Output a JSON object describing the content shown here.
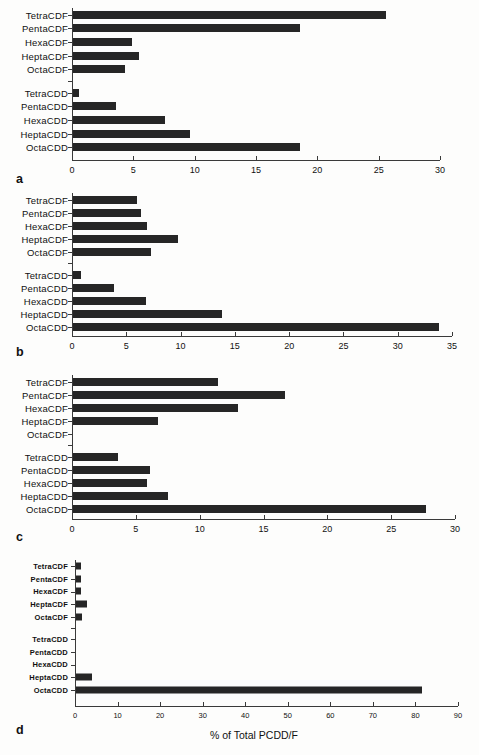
{
  "figure": {
    "xlabel": "% of Total PCDD/F",
    "bar_color": "#262626",
    "axis_color": "#3a3a3a"
  },
  "chart_data": [
    {
      "type": "bar",
      "orientation": "horizontal",
      "panel": "a",
      "title": "",
      "xlabel": "",
      "ylabel": "",
      "xlim": [
        0,
        30
      ],
      "xticks": [
        0,
        5,
        10,
        15,
        20,
        25,
        30
      ],
      "xtick_labels": [
        "0",
        "5",
        "10",
        "15",
        "20",
        "25",
        "30"
      ],
      "grid": false,
      "categories": [
        "TetraCDF",
        "PentaCDF",
        "HexaCDF",
        "HeptaCDF",
        "OctaCDF",
        "",
        "TetraCDD",
        "PentaCDD",
        "HexaCDD",
        "HeptaCDD",
        "OctaCDD"
      ],
      "values": [
        25.6,
        18.6,
        4.9,
        5.5,
        4.3,
        null,
        0.55,
        3.6,
        7.6,
        9.6,
        18.6
      ]
    },
    {
      "type": "bar",
      "orientation": "horizontal",
      "panel": "b",
      "title": "",
      "xlabel": "",
      "ylabel": "",
      "xlim": [
        0,
        35
      ],
      "xticks": [
        0,
        5,
        10,
        15,
        20,
        25,
        30,
        35
      ],
      "xtick_labels": [
        "0",
        "5",
        "10",
        "15",
        "20",
        "25",
        "30",
        "35"
      ],
      "grid": false,
      "categories": [
        "TetraCDF",
        "PentaCDF",
        "HexaCDF",
        "HeptaCDF",
        "OctaCDF",
        "",
        "TetraCDD",
        "PentaCDD",
        "HexaCDD",
        "HeptaCDD",
        "OctaCDD"
      ],
      "values": [
        6.0,
        6.4,
        6.9,
        9.8,
        7.3,
        null,
        0.8,
        3.9,
        6.8,
        13.8,
        33.8
      ]
    },
    {
      "type": "bar",
      "orientation": "horizontal",
      "panel": "c",
      "title": "",
      "xlabel": "",
      "ylabel": "",
      "xlim": [
        0,
        30
      ],
      "xticks": [
        0,
        5,
        10,
        15,
        20,
        25,
        30
      ],
      "xtick_labels": [
        "0",
        "5",
        "10",
        "15",
        "20",
        "25",
        "30"
      ],
      "grid": false,
      "categories": [
        "TetraCDF",
        "PentaCDF",
        "HexaCDF",
        "HeptaCDF",
        "OctaCDF",
        "",
        "TetraCDD",
        "PentaCDD",
        "HexaCDD",
        "HeptaCDD",
        "OctaCDD"
      ],
      "values": [
        11.4,
        16.7,
        13.0,
        6.7,
        0,
        null,
        3.6,
        6.1,
        5.9,
        7.5,
        27.7
      ]
    },
    {
      "type": "bar",
      "orientation": "horizontal",
      "panel": "d",
      "title": "",
      "xlabel": "% of Total PCDD/F",
      "ylabel": "",
      "xlim": [
        0,
        90
      ],
      "xticks": [
        0,
        10,
        20,
        30,
        40,
        50,
        60,
        70,
        80,
        90
      ],
      "xtick_labels": [
        "0",
        "10",
        "20",
        "30",
        "40",
        "50",
        "60",
        "70",
        "80",
        "90"
      ],
      "grid": false,
      "categories": [
        "TetraCDF",
        "PentaCDF",
        "HexaCDF",
        "HeptaCDF",
        "OctaCDF",
        "",
        "TetraCDD",
        "PentaCDD",
        "HexaCDD",
        "HeptaCDD",
        "OctaCDD"
      ],
      "values": [
        1.4,
        1.5,
        1.3,
        2.8,
        1.7,
        null,
        0.15,
        0.15,
        0.2,
        4.0,
        81.5
      ]
    }
  ],
  "panels": [
    {
      "letter": "a"
    },
    {
      "letter": "b"
    },
    {
      "letter": "c"
    },
    {
      "letter": "d"
    }
  ]
}
